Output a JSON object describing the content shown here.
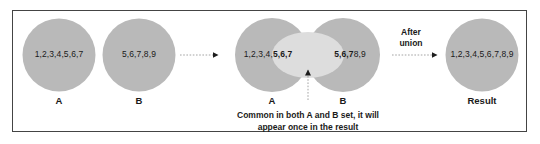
{
  "diagram": {
    "colors": {
      "circle_fill": "#b9b9b9",
      "overlap_fill": "#dcdcdc",
      "frame_border": "#444444",
      "text": "#1a1a1a",
      "arrow": "#222222",
      "background": "#ffffff"
    },
    "sets": {
      "a_contents": "1,2,3,4,5,6,7",
      "a_label": "A",
      "b_contents": "5,6,7,8,9",
      "b_label": "B"
    },
    "venn": {
      "a_unique": "1,2,3,4,",
      "a_shared": "5,6,7",
      "b_shared": "5,6,7",
      "b_unique": "8,9",
      "a_label": "A",
      "b_label": "B"
    },
    "caption": {
      "line1": "Common in both A and B set, it will",
      "line2": "appear once in the result"
    },
    "operation": {
      "line1": "After",
      "line2": "union"
    },
    "result": {
      "contents": "1,2,3,4,5,6,7,8,9",
      "label": "Result"
    }
  }
}
